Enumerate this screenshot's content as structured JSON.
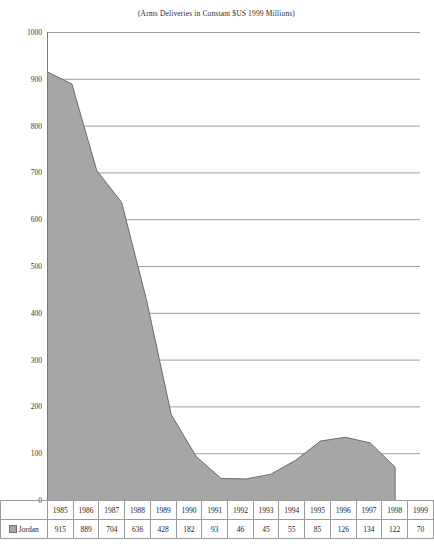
{
  "chart_title": "(Arms Deliveries in Constant $US 1999 Millions)",
  "legend": {
    "series_label": "Jordan",
    "swatch_icon": "square-swatch-icon",
    "swatch_color": "#a6a6a6"
  },
  "axes": {
    "y_ticks": [
      "1000",
      "900",
      "800",
      "700",
      "600",
      "500",
      "400",
      "300",
      "200",
      "100",
      "0"
    ]
  },
  "table": {
    "corner_label": "",
    "year_headers": [
      "1985",
      "1986",
      "1987",
      "1988",
      "1989",
      "1990",
      "1991",
      "1992",
      "1993",
      "1994",
      "1995",
      "1996",
      "1997",
      "1998",
      "1999"
    ],
    "row_label": "Jordan",
    "values": [
      "915",
      "889",
      "704",
      "636",
      "428",
      "182",
      "93",
      "46",
      "45",
      "55",
      "85",
      "126",
      "134",
      "122",
      "70"
    ]
  },
  "chart_data": {
    "type": "area",
    "title": "(Arms Deliveries in Constant $US 1999 Millions)",
    "xlabel": "",
    "ylabel": "",
    "ylim": [
      0,
      1000
    ],
    "y_ticks": [
      0,
      100,
      200,
      300,
      400,
      500,
      600,
      700,
      800,
      900,
      1000
    ],
    "grid": true,
    "legend_position": "table-left",
    "categories": [
      "1985",
      "1986",
      "1987",
      "1988",
      "1989",
      "1990",
      "1991",
      "1992",
      "1993",
      "1994",
      "1995",
      "1996",
      "1997",
      "1998",
      "1999"
    ],
    "series": [
      {
        "name": "Jordan",
        "color": "#a6a6a6",
        "line_color": "#6b6b6b",
        "values": [
          915,
          889,
          704,
          636,
          428,
          182,
          93,
          46,
          45,
          55,
          85,
          126,
          134,
          122,
          70
        ]
      }
    ]
  }
}
